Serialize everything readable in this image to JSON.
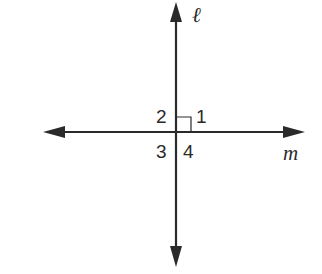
{
  "diagram": {
    "type": "perpendicular-lines",
    "lines": [
      {
        "name": "ℓ",
        "orientation": "vertical",
        "label": "ℓ"
      },
      {
        "name": "m",
        "orientation": "horizontal",
        "label": "m"
      }
    ],
    "right_angle_marker": {
      "between_angles": "1",
      "position": "upper-right"
    },
    "angle_labels": [
      {
        "label": "2",
        "quadrant": "upper-left"
      },
      {
        "label": "1",
        "quadrant": "upper-right"
      },
      {
        "label": "3",
        "quadrant": "lower-left"
      },
      {
        "label": "4",
        "quadrant": "lower-right"
      }
    ],
    "colors": {
      "stroke": "#2a2a2a",
      "background": "#ffffff"
    }
  }
}
